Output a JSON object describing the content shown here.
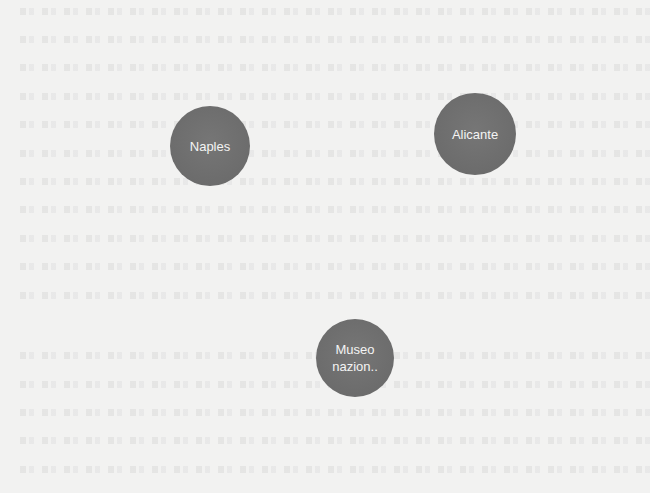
{
  "diagram": {
    "background_color": "#f2f2f1",
    "node_color": "#6e6e6e",
    "node_text_color": "#f4f4f4",
    "nodes": [
      {
        "id": "naples",
        "label": "Naples",
        "cx": 210,
        "cy": 146,
        "r": 40
      },
      {
        "id": "alicante",
        "label": "Alicante",
        "cx": 475,
        "cy": 134,
        "r": 41
      },
      {
        "id": "museo",
        "label": "Museo\nnazion..",
        "cx": 355,
        "cy": 358,
        "r": 39
      }
    ],
    "edges": []
  }
}
